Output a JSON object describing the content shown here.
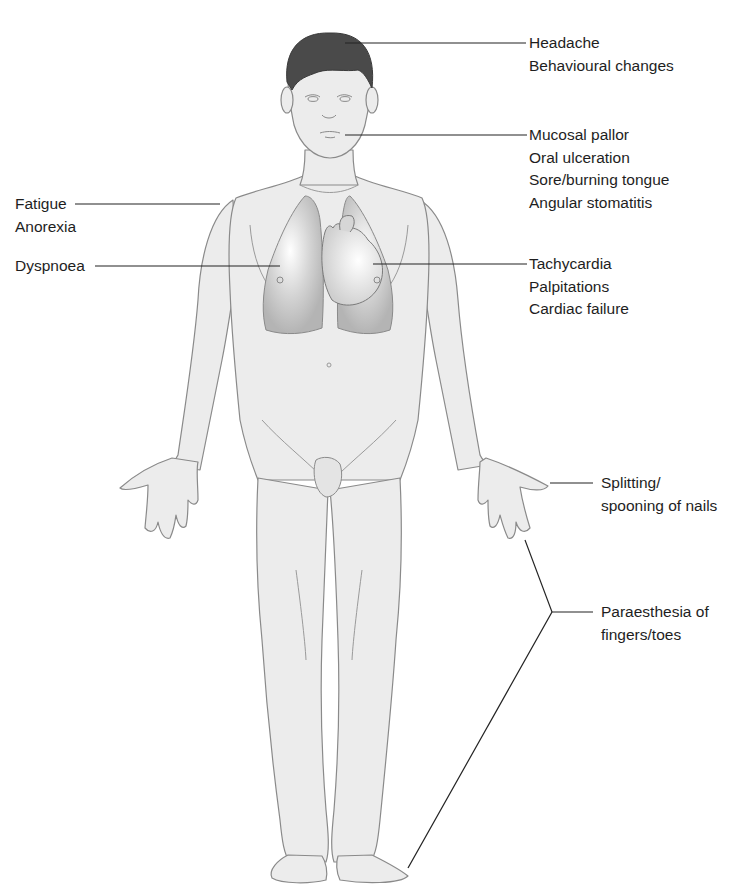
{
  "figure": {
    "colors": {
      "skin": "#ececec",
      "outline": "#8a8a8a",
      "hair": "#4a4a4a",
      "lung": "#bdbdbd",
      "heart": "#d6d6d6",
      "leader": "#222222",
      "text": "#1e1e1e"
    }
  },
  "labels": {
    "head": {
      "lines": [
        "Headache",
        "Behavioural changes"
      ]
    },
    "mouth": {
      "lines": [
        "Mucosal pallor",
        "Oral ulceration",
        "Sore/burning tongue",
        "Angular stomatitis"
      ]
    },
    "general": {
      "lines": [
        "Fatigue",
        "Anorexia"
      ]
    },
    "lungs": {
      "lines": [
        "Dyspnoea"
      ]
    },
    "heart": {
      "lines": [
        "Tachycardia",
        "Palpitations",
        "Cardiac failure"
      ]
    },
    "nails": {
      "lines": [
        "Splitting/",
        "spooning of nails"
      ]
    },
    "extremities": {
      "lines": [
        "Paraesthesia of",
        "fingers/toes"
      ]
    }
  }
}
